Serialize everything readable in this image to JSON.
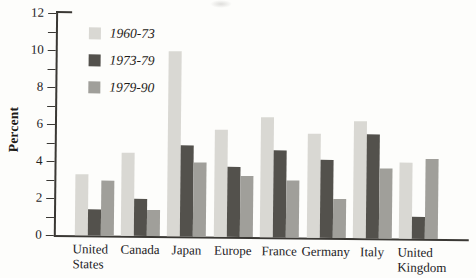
{
  "figure": {
    "background": "#fdfdfb",
    "axis_color": "#3a3834"
  },
  "chart_data": {
    "type": "bar",
    "title": "",
    "xlabel": "",
    "ylabel": "Percent",
    "ylim": [
      0,
      12
    ],
    "yticks_labeled": [
      0,
      2,
      4,
      6,
      8,
      10,
      12
    ],
    "yticks_minor": [
      1,
      3,
      5,
      7,
      9,
      11
    ],
    "grid": false,
    "legend_position": "upper-left",
    "categories": [
      "United States",
      "Canada",
      "Japan",
      "Europe",
      "France",
      "Germany",
      "Italy",
      "United Kingdom"
    ],
    "tick_label_lines": [
      [
        "United",
        "States"
      ],
      [
        "Canada"
      ],
      [
        "Japan"
      ],
      [
        "Europe"
      ],
      [
        "France"
      ],
      [
        "Germany"
      ],
      [
        "Italy"
      ],
      [
        "United",
        "Kingdom"
      ]
    ],
    "series": [
      {
        "name": "1960-73",
        "color": "#d9d8d3",
        "values": [
          3.3,
          4.5,
          10.0,
          5.8,
          6.5,
          5.6,
          6.3,
          4.1
        ]
      },
      {
        "name": "1973-79",
        "color": "#53514c",
        "values": [
          1.4,
          2.0,
          4.9,
          3.8,
          4.7,
          4.2,
          5.6,
          1.2
        ]
      },
      {
        "name": "1979-90",
        "color": "#a09f9a",
        "values": [
          3.0,
          1.4,
          4.0,
          3.3,
          3.1,
          2.1,
          3.8,
          4.3
        ]
      }
    ]
  }
}
